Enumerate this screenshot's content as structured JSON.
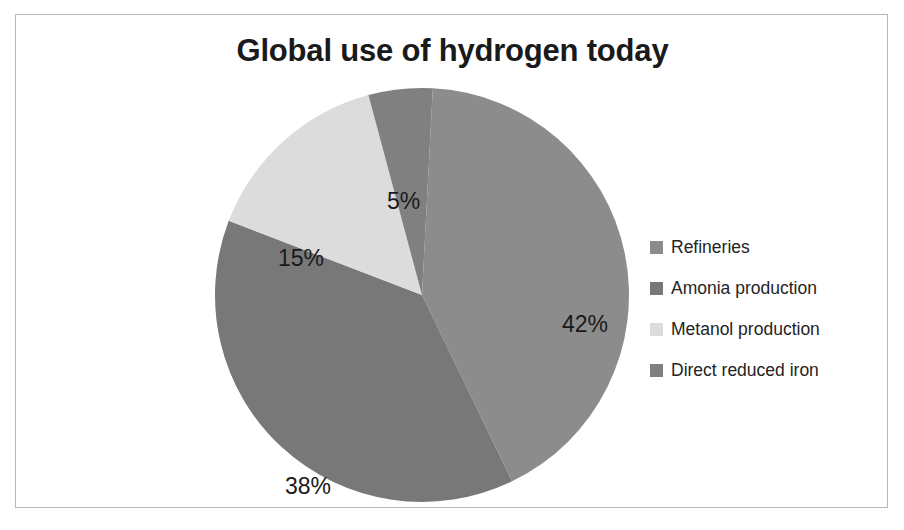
{
  "frame": {
    "border_color": "#b8b8b8",
    "background": "#ffffff"
  },
  "chart_data": {
    "type": "pie",
    "title": "Global use of hydrogen today",
    "xlabel": "",
    "ylabel": "",
    "legend_position": "right",
    "grid": false,
    "start_angle_deg": 3,
    "direction": "clockwise",
    "categories": [
      "Refineries",
      "Amonia production",
      "Metanol production",
      "Direct reduced iron"
    ],
    "values": [
      42,
      38,
      15,
      5
    ],
    "value_labels": [
      "42%",
      "38%",
      "15%",
      "5%"
    ],
    "colors": [
      "#8c8c8c",
      "#787878",
      "#dcdcdc",
      "#808080"
    ],
    "slices": [
      {
        "label": "Refineries",
        "value": 42,
        "value_label": "42%",
        "color": "#8c8c8c",
        "label_x": 352,
        "label_y": 228
      },
      {
        "label": "Amonia production",
        "value": 38,
        "value_label": "38%",
        "color": "#787878",
        "label_x": 75,
        "label_y": 390
      },
      {
        "label": "Metanol production",
        "value": 15,
        "value_label": "15%",
        "color": "#dcdcdc",
        "label_x": 68,
        "label_y": 162
      },
      {
        "label": "Direct reduced iron",
        "value": 5,
        "value_label": "5%",
        "color": "#808080",
        "label_x": 177,
        "label_y": 105
      }
    ]
  },
  "legend": {
    "items": [
      {
        "label": "Refineries",
        "color": "#8c8c8c"
      },
      {
        "label": "Amonia production",
        "color": "#787878"
      },
      {
        "label": "Metanol production",
        "color": "#dcdcdc"
      },
      {
        "label": "Direct reduced iron",
        "color": "#808080"
      }
    ]
  }
}
